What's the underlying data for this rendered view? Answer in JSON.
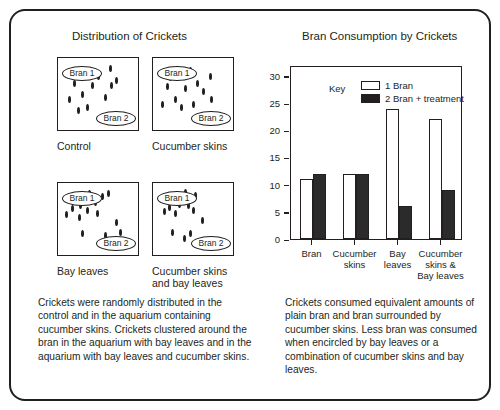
{
  "figure": {
    "left_panel_title": "Distribution of Crickets",
    "right_panel_title": "Bran Consumption by Crickets"
  },
  "aquariums": [
    {
      "name": "control",
      "label": "Control",
      "bran1": "Bran 1",
      "bran2": "Bran 2",
      "crickets": [
        [
          38,
          12
        ],
        [
          62,
          10
        ],
        [
          18,
          30
        ],
        [
          40,
          33
        ],
        [
          63,
          32
        ],
        [
          28,
          44
        ],
        [
          56,
          49
        ],
        [
          12,
          52
        ],
        [
          34,
          62
        ],
        [
          70,
          25
        ],
        [
          47,
          20
        ],
        [
          23,
          66
        ]
      ]
    },
    {
      "name": "cucumber-skins",
      "label": "Cucumber skins",
      "bran1": "Bran 1",
      "bran2": "Bran 2",
      "crickets": [
        [
          44,
          12
        ],
        [
          68,
          20
        ],
        [
          16,
          34
        ],
        [
          38,
          36
        ],
        [
          60,
          40
        ],
        [
          25,
          52
        ],
        [
          52,
          30
        ],
        [
          10,
          58
        ],
        [
          33,
          62
        ],
        [
          70,
          52
        ],
        [
          47,
          58
        ],
        [
          20,
          22
        ]
      ]
    },
    {
      "name": "bay-leaves",
      "label": "Bay leaves",
      "bran1": "Bran 1",
      "bran2": "Bran 2",
      "crickets": [
        [
          36,
          9
        ],
        [
          52,
          13
        ],
        [
          44,
          22
        ],
        [
          26,
          26
        ],
        [
          16,
          30
        ],
        [
          34,
          33
        ],
        [
          9,
          38
        ],
        [
          24,
          42
        ],
        [
          46,
          36
        ],
        [
          60,
          10
        ],
        [
          70,
          48
        ],
        [
          28,
          64
        ],
        [
          56,
          66
        ],
        [
          74,
          62
        ]
      ]
    },
    {
      "name": "cucumber-skins-and-bay-leaves",
      "label": "Cucumber skins\nand bay leaves",
      "bran1": "Bran 1",
      "bran2": "Bran 2",
      "crickets": [
        [
          38,
          8
        ],
        [
          50,
          12
        ],
        [
          30,
          24
        ],
        [
          42,
          26
        ],
        [
          18,
          28
        ],
        [
          26,
          36
        ],
        [
          48,
          33
        ],
        [
          12,
          34
        ],
        [
          58,
          46
        ],
        [
          22,
          62
        ],
        [
          44,
          64
        ],
        [
          36,
          70
        ]
      ]
    }
  ],
  "chart_data": {
    "type": "bar",
    "title": "Bran Consumption by Crickets",
    "xlabel": "",
    "ylabel": "",
    "ylim": [
      0,
      32
    ],
    "yticks": [
      0,
      5,
      10,
      15,
      20,
      25,
      30
    ],
    "grid": false,
    "legend_title": "Key",
    "legend_position": "inside-top",
    "categories": [
      "Bran",
      "Cucumber\nskins",
      "Bay\nleaves",
      "Cucumber\nskins &\nBay  leaves"
    ],
    "series": [
      {
        "name": "1 Bran",
        "fill": "#ffffff",
        "values": [
          11,
          12,
          24,
          22
        ]
      },
      {
        "name": "2 Bran + treatment",
        "fill": "#231f20",
        "values": [
          12,
          12,
          6,
          9
        ]
      }
    ]
  },
  "captions": {
    "left": "Crickets were randomly distributed in the control and in the aquarium containing cucumber skins. Crickets clustered around the bran in the aquarium with bay leaves and in the aquarium with bay leaves and cucumber skins.",
    "right": "Crickets consumed equivalent amounts of plain bran and bran surrounded by cucumber skins. Less bran was consumed when encircled by bay leaves or a combination of cucumber skins and bay leaves."
  }
}
